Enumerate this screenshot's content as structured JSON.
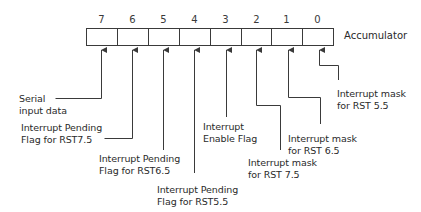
{
  "diagram": {
    "register_name": "Accumulator",
    "register": {
      "left": 86,
      "top": 28,
      "height": 17,
      "cell_width": 31,
      "bits": 8,
      "border_color": "#3a3a3a"
    },
    "bits": [
      {
        "bit": "7",
        "label_lines": [
          "Serial",
          "input data"
        ]
      },
      {
        "bit": "6",
        "label_lines": [
          "Interrupt Pending",
          "Flag for RST7.5"
        ]
      },
      {
        "bit": "5",
        "label_lines": [
          "Interrupt Pending",
          "Flag for RST6.5"
        ]
      },
      {
        "bit": "4",
        "label_lines": [
          "Interrupt Pending",
          "Flag for RST5.5"
        ]
      },
      {
        "bit": "3",
        "label_lines": [
          "Interrupt",
          "Enable Flag"
        ]
      },
      {
        "bit": "2",
        "label_lines": [
          "Interrupt mask",
          "for RST 7.5"
        ]
      },
      {
        "bit": "1",
        "label_lines": [
          "Interrupt mask",
          "for RST 6.5"
        ]
      },
      {
        "bit": "0",
        "label_lines": [
          "Interrupt mask",
          "for RST 5.5"
        ]
      }
    ],
    "line_color": "#3a3a3a"
  }
}
